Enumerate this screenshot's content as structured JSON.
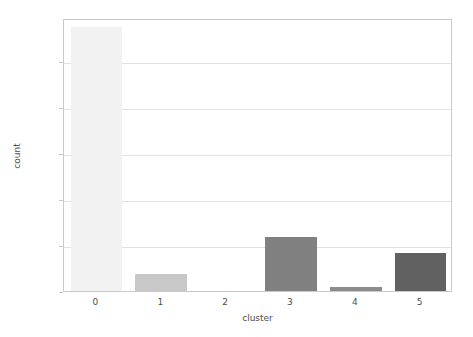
{
  "chart_data": {
    "type": "bar",
    "title": "",
    "xlabel": "cluster",
    "ylabel": "count",
    "categories": [
      "0",
      "1",
      "2",
      "3",
      "4",
      "5"
    ],
    "values": [
      115000,
      7300,
      0,
      23500,
      1800,
      16500
    ],
    "bar_colors": [
      "#f2f2f2",
      "#c8c8c8",
      "#ffffff",
      "#808080",
      "#8c8c8c",
      "#616161"
    ],
    "ylim": [
      0,
      118800
    ],
    "xlim": [
      -0.5,
      5.5
    ],
    "ytick_values": [
      0,
      20000,
      40000,
      60000,
      80000,
      100000
    ],
    "ytick_labels": [
      "0",
      "20000",
      "40000",
      "60000",
      "80000",
      "100000"
    ],
    "xtick_labels": [
      "0",
      "1",
      "2",
      "3",
      "4",
      "5"
    ],
    "grid": "horizontal",
    "legend": "none"
  },
  "axes": {
    "y_title": "count",
    "x_title": "cluster"
  },
  "colors": {
    "background": "#ffffff",
    "frame": "#c9c9c9",
    "gridline": "#e2e2e2",
    "text": "#4d4d4d"
  }
}
